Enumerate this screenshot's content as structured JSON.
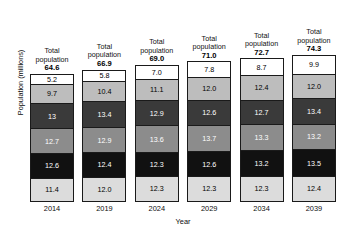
{
  "chart_data": {
    "type": "bar",
    "stacked": true,
    "title": "",
    "xlabel": "Year",
    "ylabel": "Population (millions)",
    "categories": [
      "2014",
      "2019",
      "2024",
      "2029",
      "2034",
      "2039"
    ],
    "totals_label": "Total population",
    "totals": [
      "64.6",
      "66.9",
      "69.0",
      "71.0",
      "72.7",
      "74.3"
    ],
    "grid": false,
    "legend": "none",
    "segment_order_top_to_bottom": [
      "age-band-6",
      "age-band-5",
      "age-band-4",
      "age-band-3",
      "age-band-2",
      "age-band-1"
    ],
    "segment_colors_top_to_bottom": [
      "#ffffff",
      "#bdbdbd",
      "#3a3a3a",
      "#8c8c8c",
      "#111111",
      "#dcdcdc"
    ],
    "segment_text_colors_top_to_bottom": [
      "#000000",
      "#000000",
      "#ffffff",
      "#ffffff",
      "#ffffff",
      "#000000"
    ],
    "series": [
      {
        "name": "age-band-6",
        "values": [
          5.2,
          5.8,
          7.0,
          7.8,
          8.7,
          9.9
        ],
        "labels": [
          "5.2",
          "5.8",
          "7.0",
          "7.8",
          "8.7",
          "9.9"
        ]
      },
      {
        "name": "age-band-5",
        "values": [
          9.7,
          10.4,
          11.1,
          12.0,
          12.4,
          12.0
        ],
        "labels": [
          "9.7",
          "10.4",
          "11.1",
          "12.0",
          "12.4",
          "12.0"
        ]
      },
      {
        "name": "age-band-4",
        "values": [
          13.0,
          13.4,
          12.9,
          12.6,
          12.7,
          13.4
        ],
        "labels": [
          "13",
          "13.4",
          "12.9",
          "12.6",
          "12.7",
          "13.4"
        ]
      },
      {
        "name": "age-band-3",
        "values": [
          12.7,
          12.9,
          13.6,
          13.7,
          13.3,
          13.2
        ],
        "labels": [
          "12.7",
          "12.9",
          "13.6",
          "13.7",
          "13.3",
          "13.2"
        ]
      },
      {
        "name": "age-band-2",
        "values": [
          12.6,
          12.4,
          12.3,
          12.6,
          13.2,
          13.5
        ],
        "labels": [
          "12.6",
          "12.4",
          "12.3",
          "12.6",
          "13.2",
          "13.5"
        ]
      },
      {
        "name": "age-band-1",
        "values": [
          11.4,
          12.0,
          12.3,
          12.3,
          12.3,
          12.4
        ],
        "labels": [
          "11.4",
          "12.0",
          "12.3",
          "12.3",
          "12.3",
          "12.4"
        ]
      }
    ]
  }
}
